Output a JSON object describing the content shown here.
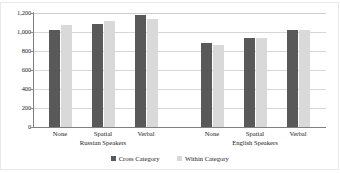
{
  "chart_data": {
    "type": "bar",
    "title": "",
    "subtitle": "",
    "xlabel": "",
    "ylabel": "",
    "ylim": [
      0,
      1200
    ],
    "ytick_labels": [
      "1,200",
      "1,000",
      "800",
      "600",
      "400",
      "200",
      "0"
    ],
    "yticks": [
      1200,
      1000,
      800,
      600,
      400,
      200,
      0
    ],
    "grid": true,
    "legend_position": "bottom-center",
    "groups": [
      {
        "name": "Russian Speakers",
        "categories": [
          "None",
          "Spatial",
          "Verbal"
        ]
      },
      {
        "name": "English Speakers",
        "categories": [
          "None",
          "Spatial",
          "Verbal"
        ]
      }
    ],
    "categories": [
      "None",
      "Spatial",
      "Verbal",
      "None",
      "Spatial",
      "Verbal"
    ],
    "series": [
      {
        "name": "Cross Category",
        "color": "#595959",
        "values": [
          1025,
          1085,
          1180,
          880,
          935,
          1020
        ]
      },
      {
        "name": "Within Category",
        "color": "#d9d9d9",
        "values": [
          1075,
          1120,
          1140,
          865,
          935,
          1020
        ]
      }
    ]
  },
  "legend": {
    "entries": [
      {
        "label": "Cross Category"
      },
      {
        "label": "Within Category"
      }
    ]
  },
  "axis": {
    "y": {
      "ticks": [
        {
          "label": "1,200"
        },
        {
          "label": "1,000"
        },
        {
          "label": "800"
        },
        {
          "label": "600"
        },
        {
          "label": "400"
        },
        {
          "label": "200"
        },
        {
          "label": "0"
        }
      ]
    },
    "x": {
      "groups": [
        {
          "label": "Russian Speakers",
          "categories": [
            {
              "label": "None"
            },
            {
              "label": "Spatial"
            },
            {
              "label": "Verbal"
            }
          ]
        },
        {
          "label": "English Speakers",
          "categories": [
            {
              "label": "None"
            },
            {
              "label": "Spatial"
            },
            {
              "label": "Verbal"
            }
          ]
        }
      ]
    }
  }
}
